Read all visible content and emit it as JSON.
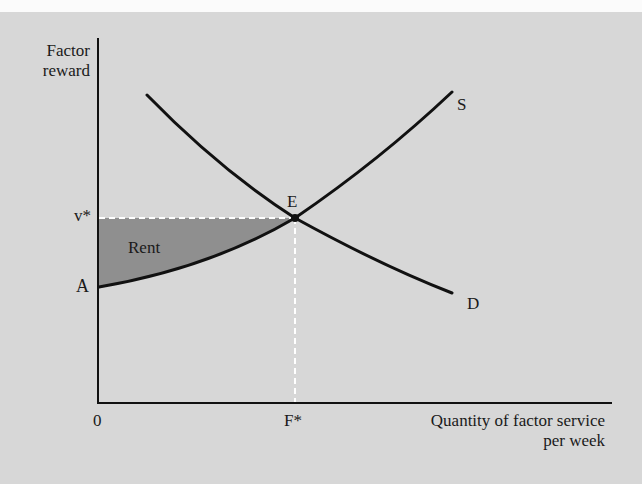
{
  "figure": {
    "y_axis_label_line1": "Factor",
    "y_axis_label_line2": "reward",
    "x_axis_label_line1": "Quantity of factor service",
    "x_axis_label_line2": "per week",
    "origin_label": "0",
    "equilibrium_price_label": "v*",
    "equilibrium_quantity_label": "F*",
    "intercept_label": "A",
    "equilibrium_point_label": "E",
    "supply_curve_label": "S",
    "demand_curve_label": "D",
    "shaded_area_label": "Rent"
  },
  "colors": {
    "background": "#d7d7d7",
    "curve": "#111111",
    "rent_fill": "#8f8f8f",
    "dashed_guides": "#ffffff"
  }
}
